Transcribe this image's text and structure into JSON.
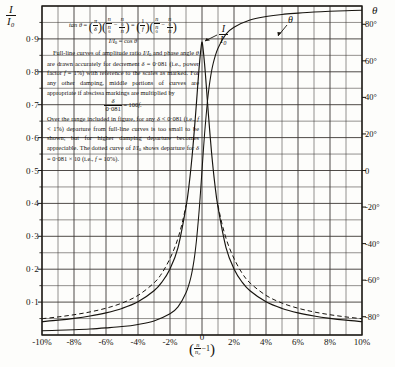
{
  "chart_data": {
    "type": "line",
    "title": "",
    "xlabel": "(n/n₀ − 1)",
    "ylabel_left": "I/I₀",
    "ylabel_right": "θ",
    "xlim": [
      -10,
      10
    ],
    "ylim_left": [
      0,
      1
    ],
    "ylim_right": [
      -90,
      90
    ],
    "grid": true,
    "x_ticks": [
      "-10%",
      "-8%",
      "-6%",
      "-4%",
      "-2%",
      "0",
      "2%",
      "4%",
      "6%",
      "8%",
      "10%"
    ],
    "x_tick_values": [
      -10,
      -8,
      -6,
      -4,
      -2,
      0,
      2,
      4,
      6,
      8,
      10
    ],
    "y_ticks_left": [
      "0·1",
      "0·2",
      "0·3",
      "0·4",
      "0·5",
      "0·6",
      "0·7",
      "0·8",
      "0·9"
    ],
    "y_tick_values_left": [
      0.1,
      0.2,
      0.3,
      0.4,
      0.5,
      0.6,
      0.7,
      0.8,
      0.9
    ],
    "y_ticks_right": [
      "80°",
      "60°",
      "40°",
      "20°",
      "0",
      "-20°",
      "-40°",
      "-60°",
      "-80°"
    ],
    "y_tick_values_right": [
      80,
      60,
      40,
      20,
      0,
      -20,
      -40,
      -60,
      -80
    ],
    "series": [
      {
        "name": "I/I₀",
        "style": "solid",
        "label": "I/I₀",
        "decrement": 0.081,
        "power_factor": "1%",
        "x": [
          -10,
          -9,
          -8,
          -7,
          -6,
          -5,
          -4,
          -3,
          -2.5,
          -2,
          -1.5,
          -1,
          -0.8,
          -0.6,
          -0.4,
          -0.3,
          -0.2,
          -0.15,
          -0.1,
          -0.05,
          -0.02,
          0,
          0.02,
          0.05,
          0.1,
          0.15,
          0.2,
          0.3,
          0.4,
          0.6,
          0.8,
          1,
          1.5,
          2,
          2.5,
          3,
          4,
          5,
          6,
          7,
          8,
          9,
          10
        ],
        "y": [
          0.0405,
          0.045,
          0.0506,
          0.0578,
          0.0674,
          0.0808,
          0.101,
          0.1345,
          0.1612,
          0.2009,
          0.2657,
          0.3885,
          0.4596,
          0.5533,
          0.6708,
          0.7364,
          0.8009,
          0.8295,
          0.8552,
          0.8771,
          0.8877,
          0.8905,
          0.8877,
          0.8771,
          0.8552,
          0.8295,
          0.8009,
          0.7364,
          0.6708,
          0.5533,
          0.4596,
          0.3885,
          0.2657,
          0.2009,
          0.1612,
          0.1345,
          0.101,
          0.0808,
          0.0674,
          0.0578,
          0.0506,
          0.045,
          0.0405
        ]
      },
      {
        "name": "θ",
        "style": "solid",
        "label": "θ",
        "x": [
          -10,
          -9,
          -8,
          -7,
          -6,
          -5,
          -4,
          -3,
          -2,
          -1.5,
          -1,
          -0.7,
          -0.5,
          -0.35,
          -0.2,
          -0.1,
          -0.05,
          0,
          0.05,
          0.1,
          0.2,
          0.35,
          0.5,
          0.7,
          1,
          1.5,
          2,
          3,
          4,
          5,
          6,
          7,
          8,
          9,
          10
        ],
        "y": [
          -87.7,
          -87.4,
          -87.1,
          -86.7,
          -86.1,
          -85.4,
          -84.2,
          -82.3,
          -78.4,
          -74.6,
          -66.9,
          -58.6,
          -49.2,
          -38.6,
          -24.2,
          -12.7,
          -6.4,
          0,
          6.4,
          12.7,
          24.2,
          38.6,
          49.2,
          58.6,
          66.9,
          74.6,
          78.4,
          82.3,
          84.2,
          85.4,
          86.1,
          86.7,
          87.1,
          87.4,
          87.7
        ]
      },
      {
        "name": "I/I₀ dotted (δ = 0·081 × 10)",
        "style": "dashed",
        "decrement": 0.81,
        "power_factor": "10%",
        "x": [
          -10,
          -9,
          -8,
          -7,
          -6,
          -5,
          -4,
          -3,
          -2.5,
          -2,
          -1.6,
          -1.3,
          -1.1,
          -1,
          1,
          1.1,
          1.3,
          1.6,
          2,
          2.5,
          3,
          4,
          5,
          6,
          7,
          8,
          9,
          10
        ],
        "y": [
          0.0495,
          0.0549,
          0.0616,
          0.0701,
          0.0814,
          0.0971,
          0.1204,
          0.1583,
          0.1884,
          0.2326,
          0.2795,
          0.3284,
          0.3704,
          0.3946,
          0.3946,
          0.3704,
          0.3284,
          0.2795,
          0.2326,
          0.1884,
          0.1583,
          0.1204,
          0.0971,
          0.0814,
          0.0701,
          0.0616,
          0.0549,
          0.0495
        ]
      }
    ],
    "annotations": [
      {
        "name": "amplitude-curve-label",
        "text": "I/I₀",
        "x": 2.0,
        "y": 0.86
      },
      {
        "name": "phase-curve-label",
        "text": "θ",
        "x": 5.6,
        "y": 0.94
      }
    ]
  },
  "axes": {
    "left_symbol_num": "I",
    "left_symbol_den": "I₀",
    "right_symbol": "θ",
    "x_axis_caption_open": "(",
    "x_axis_caption_num": "n",
    "x_axis_caption_den": "n₀",
    "x_axis_caption_tail": "−1",
    "x_axis_caption_close": ")",
    "x_zero_tick": "0"
  },
  "text_block": {
    "formula_line1_lhs": "tan θ =",
    "formula_line1": "tan θ = (π/δ)(n/n₀ − n₀/n) = (1/f)(n/n₀ − n₀/n)",
    "formula_line2": "I/I₀ = cos θ",
    "para1": "Full-line curves of amplitude ratio I/I₀ and phase angle θ are drawn accurately for decrement δ = 0·081 (i.e., power factor f = 1%) with reference to the scales as marked. For any other damping, middle portions of curves are appropriate if abscissa markings are multiplied by",
    "formula_line3": "δ / 0·081 = 100f.",
    "para2": "Over the range included in figure, for any δ < 0·081 (i.e., f < 1%) departure from full-line curves is too small to be shown; but for higher damping departure becomes appreciable. The dotted curve of I/I₀ shows departure for δ = 0·081 × 10 (i.e., f = 10%)."
  }
}
